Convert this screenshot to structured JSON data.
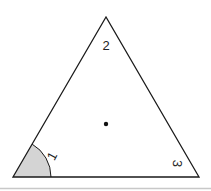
{
  "diagram": {
    "shape": "triangle",
    "vertices": {
      "apex": [
        106,
        17
      ],
      "bottom_left": [
        13,
        177
      ],
      "bottom_right": [
        199,
        177
      ]
    },
    "labels": {
      "angle_1": "1",
      "angle_2": "2",
      "angle_3": "3"
    },
    "center_point": [
      106,
      124
    ],
    "shaded_angle": "1",
    "colors": {
      "stroke": "#1a1a1a",
      "shade": "#d4d4d4",
      "dot": "#111111",
      "label": "#222222",
      "footer_line": "#c8c8c8"
    }
  }
}
